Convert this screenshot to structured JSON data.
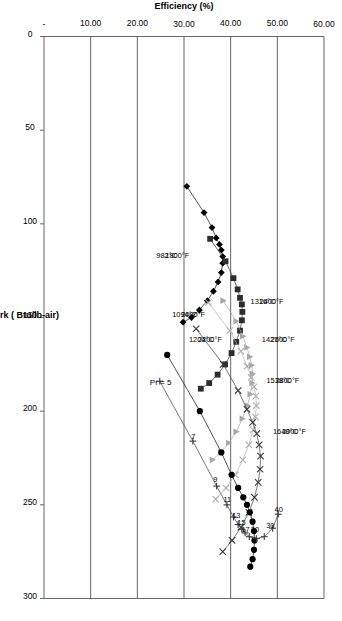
{
  "chart_data": {
    "type": "line",
    "title": "",
    "xlabel": "Net Output Work ( Btu/lb-air)",
    "ylabel": "Efficiency (%)",
    "xlim": [
      0,
      300
    ],
    "ylim": [
      0,
      60
    ],
    "xticks": [
      0,
      50,
      100,
      150,
      200,
      250,
      300
    ],
    "xticklabels": [
      "0",
      "50",
      "100",
      "150",
      "200",
      "250",
      "300"
    ],
    "yticks": [
      0,
      10,
      20,
      30,
      40,
      50,
      60
    ],
    "yticklabels": [
      "-",
      "10.00",
      "20.00",
      "30.00",
      "40.00",
      "50.00",
      "60.00"
    ],
    "grid": "y-gridlines-only",
    "legend": "inline-series-labels",
    "orientation": "rotated-90-clockwise",
    "series": [
      {
        "name": "1800F",
        "label_f": "1800°F",
        "label_c": "982°C",
        "marker": "filled-diamond",
        "color": "#000000",
        "points": [
          [
            80.0,
            30.6
          ],
          [
            94.0,
            34.3
          ],
          [
            102.0,
            36.0
          ],
          [
            107.5,
            36.9
          ],
          [
            111.0,
            37.6
          ],
          [
            114.0,
            38.0
          ],
          [
            117.5,
            38.3
          ],
          [
            121.0,
            38.3
          ],
          [
            126.0,
            38.0
          ],
          [
            131.0,
            37.3
          ],
          [
            136.0,
            36.3
          ],
          [
            141.0,
            35.0
          ],
          [
            146.0,
            33.3
          ],
          [
            150.0,
            31.6
          ],
          [
            152.5,
            29.8
          ]
        ]
      },
      {
        "name": "2000F",
        "label_f": "2000°F",
        "label_c": "1094°C",
        "marker": "filled-square",
        "color": "#2d2d2d",
        "points": [
          [
            108.0,
            35.6
          ],
          [
            120.0,
            38.9
          ],
          [
            129.0,
            40.6
          ],
          [
            135.0,
            41.5
          ],
          [
            139.5,
            42.0
          ],
          [
            143.0,
            42.4
          ],
          [
            147.0,
            42.5
          ],
          [
            151.5,
            42.4
          ],
          [
            157.0,
            42.0
          ],
          [
            163.0,
            41.2
          ],
          [
            169.0,
            40.2
          ],
          [
            175.0,
            38.8
          ],
          [
            180.5,
            37.2
          ],
          [
            185.0,
            35.4
          ],
          [
            188.0,
            33.6
          ]
        ]
      },
      {
        "name": "2200F",
        "label_f": "2200°F",
        "label_c": "1204°C",
        "marker": "filled-triangle",
        "color": "#a8a8a8",
        "points": [
          [
            141.0,
            38.4
          ],
          [
            152.0,
            41.2
          ],
          [
            160.0,
            42.6
          ],
          [
            166.0,
            43.5
          ],
          [
            171.0,
            44.1
          ],
          [
            175.5,
            44.5
          ],
          [
            180.0,
            44.7
          ],
          [
            185.0,
            44.6
          ],
          [
            191.0,
            44.2
          ],
          [
            197.0,
            43.6
          ],
          [
            204.0,
            42.5
          ],
          [
            211.0,
            41.2
          ],
          [
            217.0,
            39.6
          ],
          [
            222.0,
            37.9
          ],
          [
            226.0,
            36.1
          ]
        ]
      },
      {
        "name": "2400F",
        "label_f": "2400°F",
        "label_c": "1316°C",
        "marker": "cross-x",
        "color": "#b0b0b0",
        "points": [
          [
            142.0,
            35.2
          ],
          [
            157.0,
            39.8
          ],
          [
            168.0,
            42.2
          ],
          [
            176.0,
            43.5
          ],
          [
            182.0,
            44.4
          ],
          [
            187.0,
            45.0
          ],
          [
            192.0,
            45.4
          ],
          [
            197.0,
            45.5
          ],
          [
            203.0,
            45.3
          ],
          [
            210.0,
            44.8
          ],
          [
            218.0,
            43.9
          ],
          [
            226.0,
            42.6
          ],
          [
            234.0,
            41.0
          ],
          [
            241.0,
            39.0
          ],
          [
            247.0,
            36.8
          ]
        ]
      },
      {
        "name": "2600F",
        "label_f": "2600°F",
        "label_c": "1427°C",
        "marker": "cross-x",
        "color": "#3a3a3a",
        "points": [
          [
            156.0,
            32.6
          ],
          [
            175.0,
            38.4
          ],
          [
            189.0,
            41.6
          ],
          [
            199.0,
            43.5
          ],
          [
            206.0,
            44.7
          ],
          [
            212.0,
            45.6
          ],
          [
            218.0,
            46.1
          ],
          [
            224.0,
            46.4
          ],
          [
            231.0,
            46.3
          ],
          [
            238.0,
            45.9
          ],
          [
            246.0,
            45.1
          ],
          [
            254.0,
            43.9
          ],
          [
            262.0,
            42.2
          ],
          [
            269.0,
            40.3
          ],
          [
            275.0,
            38.3
          ]
        ]
      },
      {
        "name": "2800F",
        "label_f": "2800°F",
        "label_c": "1538°C",
        "marker": "filled-circle",
        "color": "#000000",
        "points": [
          [
            170.0,
            26.4
          ],
          [
            200.0,
            33.4
          ],
          [
            222.0,
            38.0
          ],
          [
            234.0,
            40.2
          ],
          [
            241.0,
            41.6
          ],
          [
            246.0,
            42.7
          ],
          [
            250.0,
            43.5
          ],
          [
            254.0,
            44.1
          ],
          [
            259.0,
            44.7
          ],
          [
            264.0,
            45.0
          ],
          [
            269.0,
            45.1
          ],
          [
            274.0,
            45.0
          ],
          [
            279.0,
            44.7
          ],
          [
            283.0,
            44.2
          ]
        ]
      },
      {
        "name": "3000F",
        "label_f": "3000°F",
        "label_c": "1649°C",
        "marker": "plus",
        "color": "#3a3a3a",
        "points": [
          [
            184.0,
            24.8
          ],
          [
            216.0,
            31.9
          ],
          [
            240.0,
            37.0
          ],
          [
            250.0,
            39.2
          ],
          [
            256.5,
            40.6
          ],
          [
            260.5,
            41.6
          ],
          [
            263.0,
            42.4
          ],
          [
            265.0,
            43.1
          ],
          [
            267.0,
            44.0
          ],
          [
            268.0,
            45.5
          ],
          [
            267.0,
            47.2
          ],
          [
            262.5,
            49.0
          ],
          [
            255.0,
            50.2
          ]
        ]
      }
    ],
    "pressure_ratio_annotations": [
      {
        "label": "Pr = 5",
        "value": 5,
        "x": 186.0,
        "y": 25.0
      },
      {
        "label": "7",
        "value": 7,
        "x": 215.0,
        "y": 32.0
      },
      {
        "label": "9",
        "value": 9,
        "x": 238.0,
        "y": 36.7
      },
      {
        "label": "11",
        "value": 11,
        "x": 248.5,
        "y": 39.3
      },
      {
        "label": "13",
        "value": 13,
        "x": 257.0,
        "y": 41.2
      },
      {
        "label": "15",
        "value": 15,
        "x": 261.0,
        "y": 42.3
      },
      {
        "label": "17",
        "value": 17,
        "x": 264.5,
        "y": 43.2
      },
      {
        "label": "20",
        "value": 20,
        "x": 264.5,
        "y": 45.2
      },
      {
        "label": "30",
        "value": 30,
        "x": 262.5,
        "y": 48.5
      },
      {
        "label": "40",
        "value": 40,
        "x": 254.0,
        "y": 50.3
      }
    ]
  }
}
